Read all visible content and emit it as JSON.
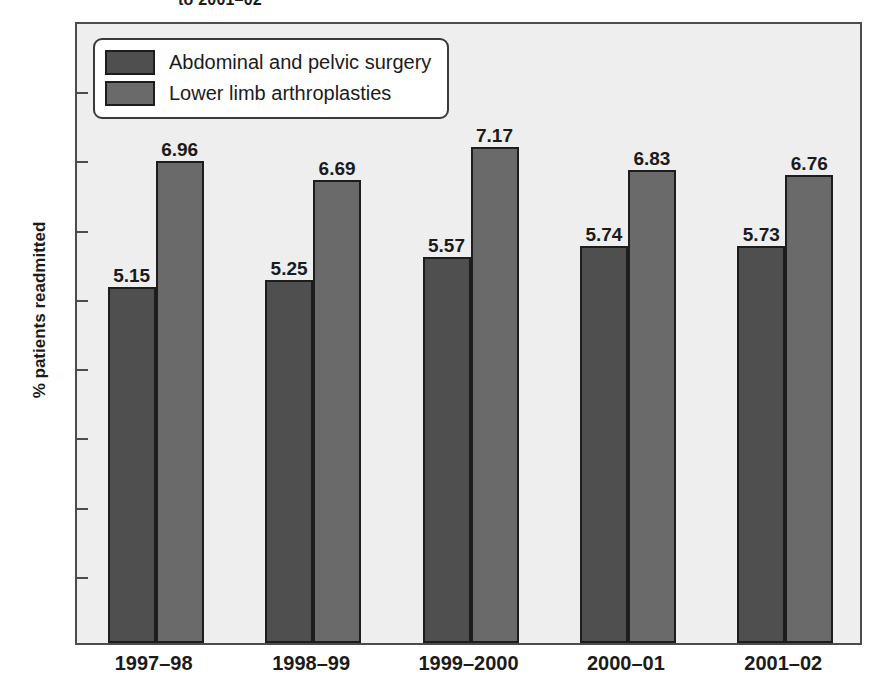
{
  "chart_data": {
    "type": "bar",
    "title": "to 2001–02",
    "subtitle": "",
    "xlabel": "",
    "ylabel": "% patients readmitted",
    "ylim": [
      0,
      9
    ],
    "yticks": [
      0,
      1,
      2,
      3,
      4,
      5,
      6,
      7,
      8,
      9
    ],
    "ytick_labels": [
      "0",
      "1",
      "2",
      "3",
      "4",
      "5",
      "6",
      "7",
      "8",
      "9"
    ],
    "grid": false,
    "legend_position": "upper-left-inside",
    "categories": [
      "1997–98",
      "1998–99",
      "1999–2000",
      "2000–01",
      "2001–02"
    ],
    "series": [
      {
        "name": "Abdominal and pelvic surgery",
        "color": "#4f4f4f",
        "values": [
          5.15,
          5.25,
          5.57,
          5.74,
          5.73
        ],
        "value_labels": [
          "5.15",
          "5.25",
          "5.57",
          "5.74",
          "5.73"
        ]
      },
      {
        "name": "Lower limb arthroplasties",
        "color": "#6a6a6a",
        "values": [
          6.96,
          6.69,
          7.17,
          6.83,
          6.76
        ],
        "value_labels": [
          "6.96",
          "6.69",
          "7.17",
          "6.83",
          "6.76"
        ]
      }
    ]
  },
  "colors": {
    "series_dark": "#4f4f4f",
    "series_light": "#6a6a6a",
    "plot_background": "#eeeeee",
    "axis_line": "#4c4c4c",
    "bar_outline": "#1d1d1d",
    "text": "#1b1b1b",
    "legend_background": "#ffffff"
  }
}
